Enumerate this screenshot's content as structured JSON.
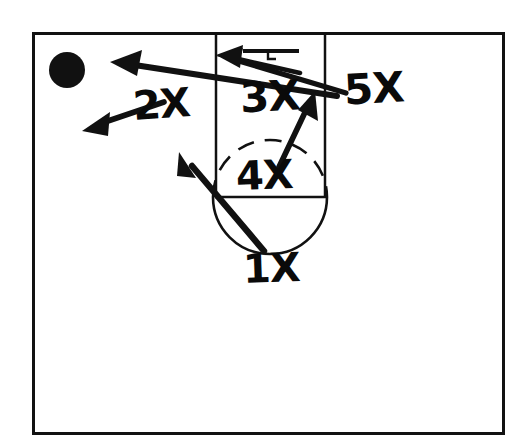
{
  "diagram": {
    "kind": "basketball-half-court-play-diagram",
    "title": "",
    "ink_color": "#111111",
    "court_color": "#ffffff",
    "court": {
      "border": {
        "x": 32,
        "y": 32,
        "width": 471,
        "height": 402,
        "stroke_width": 3
      },
      "lane": {
        "left_x": 216,
        "right_x": 325,
        "top_y": 33,
        "bottom_y": 197,
        "stroke_width": 2.5
      },
      "free_throw_line": {
        "x1": 216,
        "y1": 197,
        "x2": 325,
        "y2": 197
      },
      "free_throw_circle": {
        "cx": 270,
        "cy": 197,
        "r": 57,
        "upper_half": "dashed",
        "lower_half": "solid"
      },
      "backboard": {
        "x1": 243,
        "y1": 51,
        "x2": 298,
        "y2": 51
      },
      "rim": {
        "cx": 268,
        "cy": 58,
        "r": 4
      },
      "baseline_y": 33
    },
    "ball": {
      "label": "ball",
      "cx": 67,
      "cy": 70,
      "r": 18,
      "fill": "#111111"
    },
    "players": [
      {
        "id": "1X",
        "label": "1X",
        "x": 243,
        "y": 248
      },
      {
        "id": "2X",
        "label": "2X",
        "x": 133,
        "y": 84
      },
      {
        "id": "3X",
        "label": "3X",
        "x": 240,
        "y": 76
      },
      {
        "id": "4X",
        "label": "4X",
        "x": 236,
        "y": 155
      },
      {
        "id": "5X",
        "label": "5X",
        "x": 344,
        "y": 68
      }
    ],
    "movements": [
      {
        "id": "arrow-5x-to-basket",
        "for_player": "5X",
        "description": "5X cuts from right wing to the basket",
        "from": {
          "x": 346,
          "y": 92
        },
        "to": {
          "x": 216,
          "y": 56
        },
        "arrowhead": "to"
      },
      {
        "id": "arrow-3x-to-wing",
        "for_player": "3X",
        "description": "long pass / cut from low post area out to the left wing",
        "from": {
          "x": 337,
          "y": 95
        },
        "to": {
          "x": 110,
          "y": 62
        },
        "arrowhead": "to"
      },
      {
        "id": "arrow-2x-out",
        "for_player": "2X",
        "description": "2X moves down-left toward the corner",
        "from": {
          "x": 163,
          "y": 101
        },
        "to": {
          "x": 83,
          "y": 130
        },
        "arrowhead": "to"
      },
      {
        "id": "arrow-4x-up",
        "for_player": "4X",
        "description": "4X flashes up from the free-throw circle toward the high right elbow",
        "from": {
          "x": 279,
          "y": 165
        },
        "to": {
          "x": 314,
          "y": 93
        },
        "arrowhead": "to"
      },
      {
        "id": "arrow-1x-up-left",
        "for_player": "1X",
        "description": "1X drives from the top of the key up to the left elbow",
        "from": {
          "x": 264,
          "y": 252
        },
        "to": {
          "x": 179,
          "y": 153
        },
        "arrowhead": "to"
      }
    ]
  }
}
